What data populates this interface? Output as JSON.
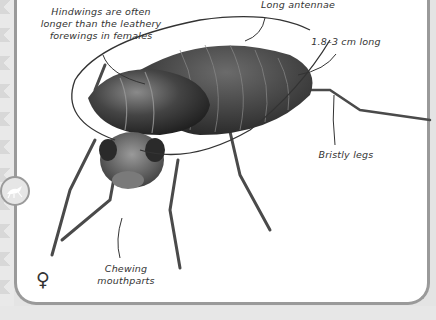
{
  "labels": {
    "hindwings": "Hindwings are often longer than the leathery forewings in females",
    "antennae": "Long antennae",
    "length": "1.8–3 cm long",
    "legs": "Bristly legs",
    "mouthparts": "Chewing mouthparts"
  },
  "icons": {
    "badge": "insect-grasshopper-icon",
    "sex": "female-symbol-icon"
  },
  "female_symbol": "♀"
}
